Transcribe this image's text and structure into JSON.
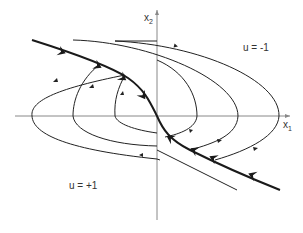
{
  "diagram": {
    "type": "phase-portrait",
    "axes": {
      "x_label": "x",
      "x_sub": "1",
      "y_label": "x",
      "y_sub": "2"
    },
    "regions": [
      {
        "label": "u = -1",
        "side": "upper-right"
      },
      {
        "label": "u = +1",
        "side": "lower-left"
      }
    ],
    "switching_curve": {
      "description": "thick curve through origin with bold arrows pointing toward origin"
    },
    "trajectories": {
      "u_plus_1_count": 3,
      "u_minus_1_count": 3
    },
    "colors": {
      "curve": "#1a1a1a",
      "axis": "#888888",
      "text": "#333333"
    }
  }
}
